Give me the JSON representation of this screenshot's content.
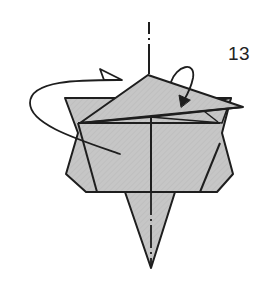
{
  "diagram": {
    "type": "origami-fold-instruction",
    "step_number": "13",
    "colors": {
      "paper_fill": "#c4c4c4",
      "line": "#1e1e1e",
      "background": "#ffffff"
    },
    "elements": [
      {
        "name": "mountain-fold-centerline",
        "style": "dash-dot"
      },
      {
        "name": "turn-over-arrow",
        "direction": "counterclockwise-around-back"
      },
      {
        "name": "fold-down-arrow",
        "target": "top-flap"
      },
      {
        "name": "body-pentagon"
      },
      {
        "name": "top-triangle-flap"
      },
      {
        "name": "bottom-point"
      }
    ]
  }
}
